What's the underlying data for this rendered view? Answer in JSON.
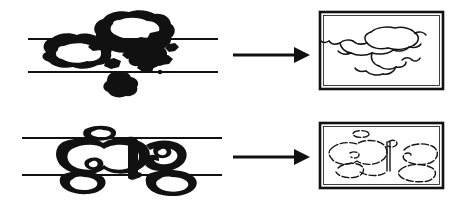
{
  "figure": {
    "title": "",
    "caption": "",
    "background_color": "#ffffff",
    "ink_color": "#111111",
    "rows": [
      {
        "id": "row-top",
        "input": {
          "name": "thick-handwritten-glyph",
          "description": "thick blobby handwritten Burmese glyph crossing two baselines",
          "guide_lines": [
            {
              "name": "upper-baseline",
              "x1": 28,
              "y1": 39,
              "x2": 218,
              "y2": 39
            },
            {
              "name": "lower-baseline",
              "x1": 28,
              "y1": 72,
              "x2": 218,
              "y2": 72
            }
          ]
        },
        "arrow": {
          "name": "transform-arrow",
          "label": "",
          "x1": 233,
          "y1": 55,
          "x2": 308,
          "y2": 55
        },
        "output": {
          "name": "skeletonized-glyph",
          "description": "thinned single-pixel skeleton of the glyph inside a framed box",
          "box": {
            "x": 319,
            "y": 11,
            "width": 125,
            "height": 79
          }
        }
      },
      {
        "id": "row-bottom",
        "input": {
          "name": "thick-printed-glyph",
          "description": "thick rounded printed Burmese glyph crossing two baselines",
          "guide_lines": [
            {
              "name": "upper-baseline",
              "x1": 22,
              "y1": 138,
              "x2": 222,
              "y2": 138
            },
            {
              "name": "lower-baseline",
              "x1": 22,
              "y1": 175,
              "x2": 222,
              "y2": 175
            }
          ]
        },
        "arrow": {
          "name": "transform-arrow",
          "label": "",
          "x1": 233,
          "y1": 157,
          "x2": 310,
          "y2": 157
        },
        "output": {
          "name": "contour-outline-glyph",
          "description": "dashed contour outline of the glyph inside a framed box",
          "box": {
            "x": 319,
            "y": 122,
            "width": 125,
            "height": 67
          }
        }
      }
    ]
  }
}
